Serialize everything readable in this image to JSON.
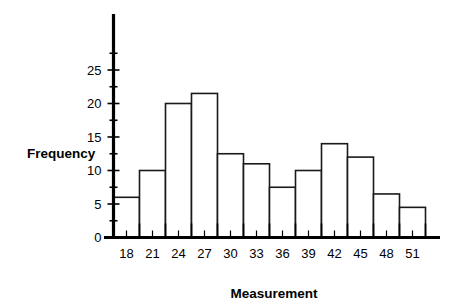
{
  "chart_data": {
    "type": "bar",
    "title": "",
    "subtitle": "",
    "xlabel": "Measurement",
    "ylabel": "Frequency",
    "categories": [
      "18",
      "21",
      "24",
      "27",
      "30",
      "33",
      "36",
      "39",
      "42",
      "45",
      "48",
      "51"
    ],
    "values": [
      6,
      10,
      20,
      21.5,
      12.5,
      11,
      7.5,
      10,
      14,
      12,
      6.5,
      4.5
    ],
    "bin_edges": [
      16.5,
      19.5,
      22.5,
      25.5,
      28.5,
      31.5,
      34.5,
      37.5,
      40.5,
      43.5,
      46.5,
      49.5,
      52.5
    ],
    "bin_width": 3,
    "xlim": [
      16.5,
      54.0
    ],
    "ylim": [
      0,
      27.5
    ],
    "y_ticks_major": [
      0,
      5,
      10,
      15,
      20,
      25
    ],
    "y_tick_labels": [
      "0",
      "5",
      "10",
      "15",
      "20",
      "25"
    ],
    "y_ticks_minor": [
      2.5,
      7.5,
      12.5,
      17.5,
      22.5,
      27.5
    ],
    "x_tick_labels": [
      "18",
      "21",
      "24",
      "27",
      "30",
      "33",
      "36",
      "39",
      "42",
      "45",
      "48",
      "51"
    ],
    "grid": false,
    "legend": null,
    "bar_fill_color": "#ffffff",
    "bar_edge_color": "#1a1a1a",
    "axis_color": "#000000",
    "background_color": "#ffffff"
  },
  "axes": {
    "y_axis_title": "Frequency",
    "x_axis_title": "Measurement"
  }
}
